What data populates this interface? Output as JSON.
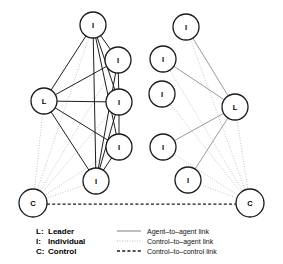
{
  "figure": {
    "title": "",
    "width": 283,
    "height": 264,
    "background": "#ffffff"
  },
  "colors": {
    "node_stroke": "#1a1a1a",
    "node_fill": "#ffffff",
    "agent_link": "#111111",
    "agent_link_light": "#6f6f6f",
    "control_link": "#9a9a9a",
    "control_control_link": "#1a1a1a",
    "text": "#000000"
  },
  "node_types": {
    "leader": "L",
    "individual": "I",
    "control": "C"
  },
  "networks": [
    {
      "name": "left-network",
      "density": "dense",
      "nodes": [
        {
          "id": "L1-I1",
          "label": "I",
          "type": "individual",
          "x": 93,
          "y": 25,
          "r": 13
        },
        {
          "id": "L1-I2",
          "label": "I",
          "type": "individual",
          "x": 118,
          "y": 60,
          "r": 13
        },
        {
          "id": "L1-I3",
          "label": "I",
          "type": "individual",
          "x": 119,
          "y": 102,
          "r": 13
        },
        {
          "id": "L1-I4",
          "label": "I",
          "type": "individual",
          "x": 119,
          "y": 147,
          "r": 13
        },
        {
          "id": "L1-I5",
          "label": "I",
          "type": "individual",
          "x": 96,
          "y": 181,
          "r": 13
        },
        {
          "id": "L1-L",
          "label": "L",
          "type": "leader",
          "x": 44,
          "y": 101,
          "r": 13
        },
        {
          "id": "L1-C",
          "label": "C",
          "type": "control",
          "x": 33,
          "y": 203,
          "r": 14
        }
      ],
      "agent_links": [
        [
          "L1-I1",
          "L1-I2"
        ],
        [
          "L1-I1",
          "L1-I3"
        ],
        [
          "L1-I1",
          "L1-I4"
        ],
        [
          "L1-I1",
          "L1-I5"
        ],
        [
          "L1-I1",
          "L1-L"
        ],
        [
          "L1-I2",
          "L1-I3"
        ],
        [
          "L1-I2",
          "L1-I5"
        ],
        [
          "L1-I2",
          "L1-L"
        ],
        [
          "L1-I3",
          "L1-I4"
        ],
        [
          "L1-I3",
          "L1-I5"
        ],
        [
          "L1-I3",
          "L1-L"
        ],
        [
          "L1-I4",
          "L1-I5"
        ],
        [
          "L1-I4",
          "L1-L"
        ],
        [
          "L1-I5",
          "L1-L"
        ]
      ],
      "control_links": [
        [
          "L1-C",
          "L1-I1"
        ],
        [
          "L1-C",
          "L1-I2"
        ],
        [
          "L1-C",
          "L1-I3"
        ],
        [
          "L1-C",
          "L1-I4"
        ],
        [
          "L1-C",
          "L1-I5"
        ],
        [
          "L1-C",
          "L1-L"
        ]
      ]
    },
    {
      "name": "right-network",
      "density": "sparse",
      "nodes": [
        {
          "id": "R1-I1",
          "label": "I",
          "type": "individual",
          "x": 186,
          "y": 27,
          "r": 13
        },
        {
          "id": "R1-I2",
          "label": "I",
          "type": "individual",
          "x": 163,
          "y": 59,
          "r": 13
        },
        {
          "id": "R1-I3",
          "label": "I",
          "type": "individual",
          "x": 162,
          "y": 94,
          "r": 13
        },
        {
          "id": "R1-I4",
          "label": "I",
          "type": "individual",
          "x": 163,
          "y": 147,
          "r": 13
        },
        {
          "id": "R1-I5",
          "label": "I",
          "type": "individual",
          "x": 188,
          "y": 180,
          "r": 13
        },
        {
          "id": "R1-L",
          "label": "L",
          "type": "leader",
          "x": 235,
          "y": 107,
          "r": 13
        },
        {
          "id": "R1-C",
          "label": "C",
          "type": "control",
          "x": 250,
          "y": 203,
          "r": 14
        }
      ],
      "agent_links": [
        [
          "R1-I1",
          "R1-L"
        ],
        [
          "R1-I2",
          "R1-L"
        ],
        [
          "R1-I4",
          "R1-L"
        ],
        [
          "R1-I5",
          "R1-L"
        ]
      ],
      "control_links": [
        [
          "R1-C",
          "R1-I1"
        ],
        [
          "R1-C",
          "R1-I2"
        ],
        [
          "R1-C",
          "R1-I3"
        ],
        [
          "R1-C",
          "R1-I4"
        ],
        [
          "R1-C",
          "R1-I5"
        ],
        [
          "R1-C",
          "R1-L"
        ]
      ]
    }
  ],
  "control_to_control": {
    "from": "L1-C",
    "to": "R1-C",
    "label": "Control-to-control link"
  },
  "legend": {
    "node_key": [
      {
        "key": "L:",
        "term": "Leader"
      },
      {
        "key": "I:",
        "term": "Individual"
      },
      {
        "key": "C:",
        "term": "Control"
      }
    ],
    "link_key": [
      {
        "style": "solid",
        "label": "Agent–to–agent link"
      },
      {
        "style": "dotted",
        "label": "Control–to–agent link"
      },
      {
        "style": "dashed",
        "label": "Control–to–control link"
      }
    ]
  }
}
